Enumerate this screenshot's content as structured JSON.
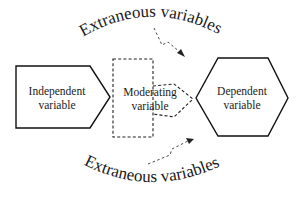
{
  "diagram": {
    "type": "conceptual-model",
    "nodes": {
      "independent": {
        "line1": "Independent",
        "line2": "variable",
        "shape": "pentagon-arrow"
      },
      "moderating": {
        "line1": "Moderating",
        "line2": "variable",
        "shape": "dashed-box-arrow"
      },
      "dependent": {
        "line1": "Dependent",
        "line2": "variable",
        "shape": "hexagon"
      }
    },
    "extraneous_top": {
      "label": "Extraneous variables",
      "arrow_style": "dashed-lightning",
      "direction": "down-right"
    },
    "extraneous_bottom": {
      "label": "Extraneous variables",
      "arrow_style": "dashed-lightning",
      "direction": "up-right"
    },
    "colors": {
      "stroke": "#111111",
      "text": "#1a1a1a",
      "background": "#ffffff"
    }
  }
}
